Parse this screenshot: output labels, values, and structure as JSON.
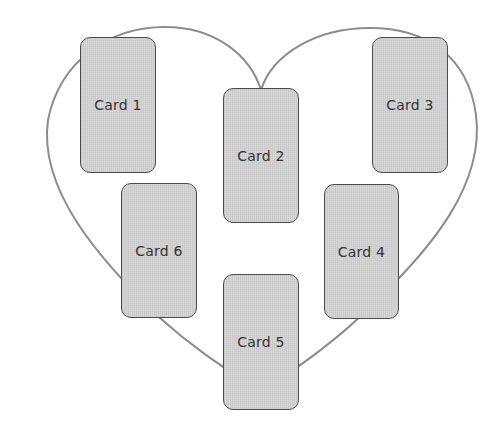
{
  "diagram": {
    "shape": "heart-outline",
    "outline_color": "#8c8c8c",
    "card_fill": "#d3d3d3",
    "card_border": "#4a4a4a",
    "label_color": "#333333",
    "cards": [
      {
        "label": "Card 1",
        "x": 80,
        "y": 37,
        "w": 76,
        "h": 136
      },
      {
        "label": "Card 2",
        "x": 223,
        "y": 88,
        "w": 76,
        "h": 135
      },
      {
        "label": "Card 3",
        "x": 372,
        "y": 37,
        "w": 76,
        "h": 136
      },
      {
        "label": "Card 4",
        "x": 324,
        "y": 184,
        "w": 75,
        "h": 135
      },
      {
        "label": "Card 5",
        "x": 223,
        "y": 274,
        "w": 76,
        "h": 136
      },
      {
        "label": "Card 6",
        "x": 121,
        "y": 183,
        "w": 76,
        "h": 135
      }
    ]
  }
}
